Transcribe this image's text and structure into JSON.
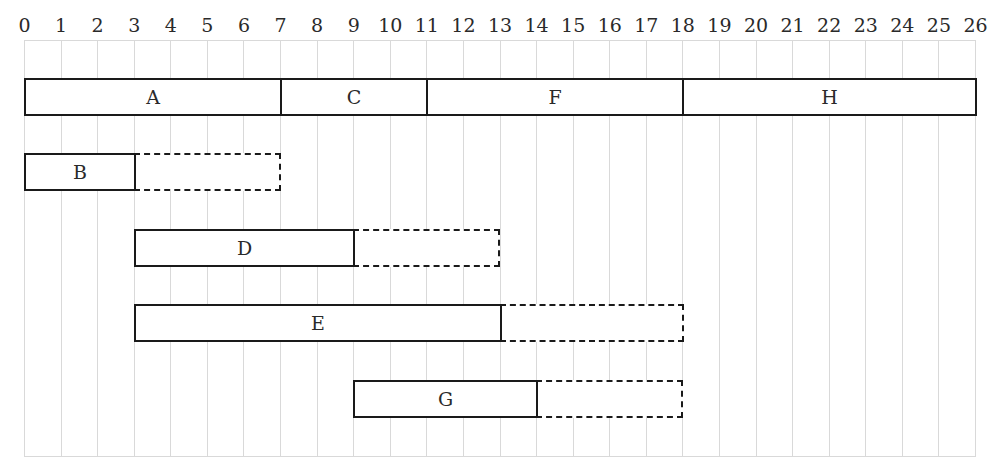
{
  "chart_data": {
    "type": "gantt",
    "title": "",
    "axis": {
      "min": 0,
      "max": 26,
      "ticks": [
        0,
        1,
        2,
        3,
        4,
        5,
        6,
        7,
        8,
        9,
        10,
        11,
        12,
        13,
        14,
        15,
        16,
        17,
        18,
        19,
        20,
        21,
        22,
        23,
        24,
        25,
        26
      ]
    },
    "grid": true,
    "rows": [
      {
        "row": 0,
        "tasks": [
          {
            "label": "A",
            "start": 0,
            "end": 7,
            "slack_end": null
          },
          {
            "label": "C",
            "start": 7,
            "end": 11,
            "slack_end": null
          },
          {
            "label": "F",
            "start": 11,
            "end": 18,
            "slack_end": null
          },
          {
            "label": "H",
            "start": 18,
            "end": 26,
            "slack_end": null
          }
        ]
      },
      {
        "row": 1,
        "tasks": [
          {
            "label": "B",
            "start": 0,
            "end": 3,
            "slack_end": 7
          }
        ]
      },
      {
        "row": 2,
        "tasks": [
          {
            "label": "D",
            "start": 3,
            "end": 9,
            "slack_end": 13
          }
        ]
      },
      {
        "row": 3,
        "tasks": [
          {
            "label": "E",
            "start": 3,
            "end": 13,
            "slack_end": 18
          }
        ]
      },
      {
        "row": 4,
        "tasks": [
          {
            "label": "G",
            "start": 9,
            "end": 14,
            "slack_end": 18
          }
        ]
      }
    ],
    "legend": {
      "solid": "activity duration",
      "dashed": "float / slack"
    }
  },
  "colors": {
    "grid": "#d9d9d9",
    "bar_border": "#1a1a1a",
    "background": "#ffffff"
  }
}
